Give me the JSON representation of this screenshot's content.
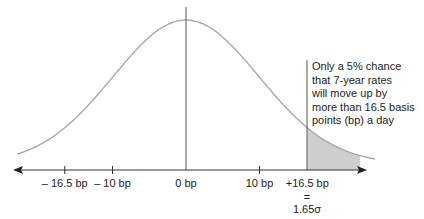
{
  "chart_data": {
    "type": "area",
    "title": "",
    "xlabel": "",
    "ylabel": "",
    "x_ticks": [
      {
        "value": -16.5,
        "label": "– 16.5 bp"
      },
      {
        "value": -10,
        "label": "– 10 bp"
      },
      {
        "value": 0,
        "label": "0 bp"
      },
      {
        "value": 10,
        "label": "10 bp"
      },
      {
        "value": 16.5,
        "label": "+16.5 bp"
      }
    ],
    "sigma_note": {
      "equals": "=",
      "value": "1.65σ"
    },
    "shaded_region": {
      "from": 16.5,
      "to": "right tail",
      "probability": 0.05
    },
    "annotation": [
      "Only a 5% chance",
      "that 7-year rates",
      "will move up by",
      "more than 16.5 basis",
      "points (bp) a day"
    ],
    "distribution": {
      "mean": 0,
      "sigma_bp": 10
    },
    "grid": false,
    "legend": null
  },
  "colors": {
    "curve": "#a8a8a8",
    "axis": "#333333",
    "shade": "#cfcfcf",
    "text": "#222222"
  }
}
